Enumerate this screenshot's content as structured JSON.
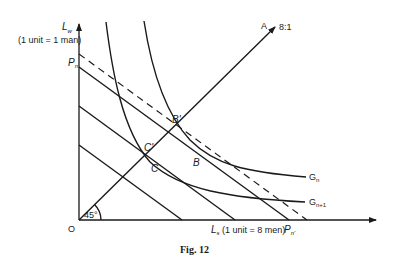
{
  "figure": {
    "caption": "Fig. 12",
    "y_axis": {
      "label": "L",
      "label_sub": "w",
      "unit_note": "(1 unit = 1 man)"
    },
    "x_axis": {
      "label": "L",
      "label_sub": "s",
      "unit_note": "(1 unit = 8 men)"
    },
    "origin_label": "O",
    "angle_label": "45°",
    "ray": {
      "label": "A",
      "ratio": "8:1"
    },
    "points": {
      "Pn": "P",
      "Pn_sub": "n",
      "Pn_prime": "P",
      "Pn_prime_sub": "n'",
      "B_prime": "B'",
      "B": "B",
      "C_prime": "C'",
      "C": "C"
    },
    "curves": {
      "Gn": "G",
      "Gn_sub": "n",
      "Gn1": "G",
      "Gn1_sub": "n+1"
    }
  },
  "colors": {
    "ink": "#1a1a1a",
    "background": "#ffffff"
  }
}
